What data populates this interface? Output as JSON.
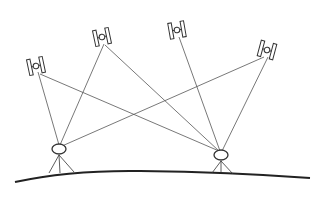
{
  "diagram": {
    "caption": "",
    "colors": {
      "line": "#555555",
      "ground": "#222222",
      "satellite": "#333333"
    },
    "satellites": [
      {
        "id": "sat1",
        "x": 36,
        "y": 66,
        "rot": -12
      },
      {
        "id": "sat2",
        "x": 102,
        "y": 37,
        "rot": -12
      },
      {
        "id": "sat3",
        "x": 177,
        "y": 30,
        "rot": -10
      },
      {
        "id": "sat4",
        "x": 267,
        "y": 50,
        "rot": 15
      }
    ],
    "receivers": [
      {
        "id": "receiver-a",
        "x": 59,
        "y": 149,
        "links": [
          "sat1",
          "sat2",
          "sat4"
        ]
      },
      {
        "id": "receiver-b",
        "x": 221,
        "y": 155,
        "links": [
          "sat1",
          "sat2",
          "sat3",
          "sat4"
        ]
      }
    ]
  }
}
